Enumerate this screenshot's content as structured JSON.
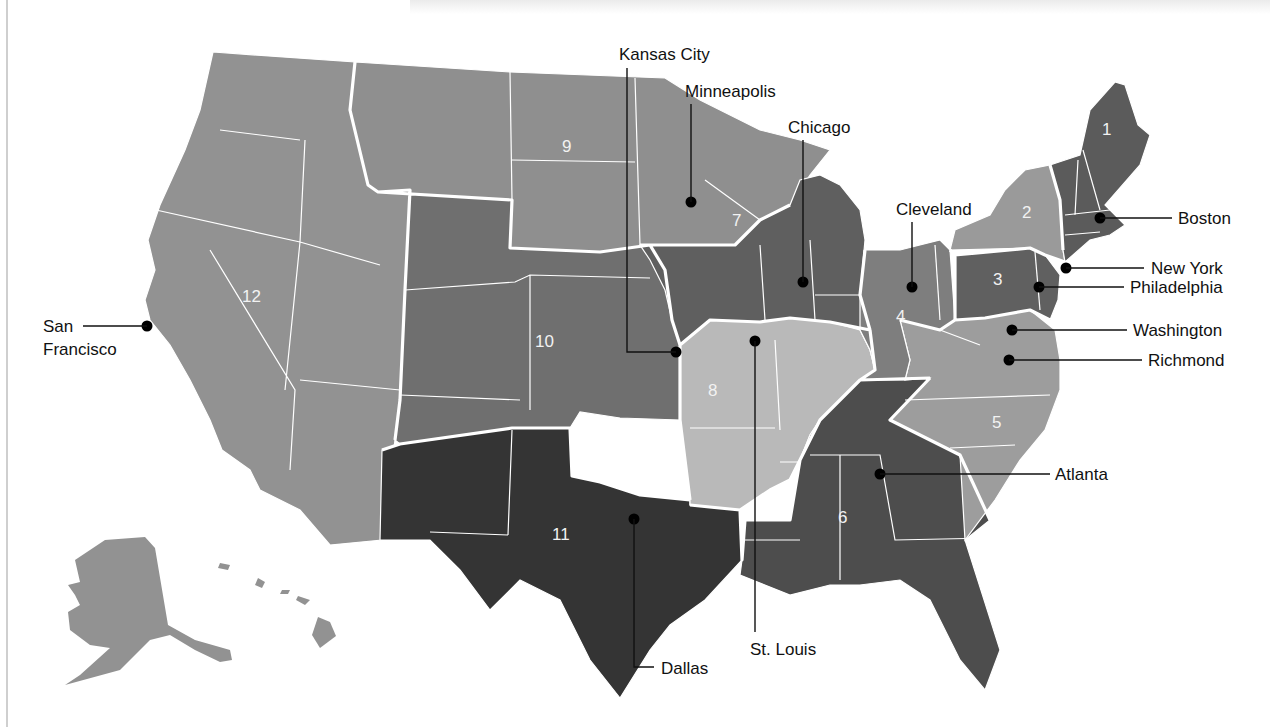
{
  "map": {
    "title": "Federal Reserve Districts",
    "districts": [
      {
        "number": "1",
        "name": "Boston",
        "color": "#5b5b5b"
      },
      {
        "number": "2",
        "name": "New York",
        "color": "#9a9a9a"
      },
      {
        "number": "3",
        "name": "Philadelphia",
        "color": "#606060"
      },
      {
        "number": "4",
        "name": "Cleveland",
        "color": "#7e7e7e"
      },
      {
        "number": "5",
        "name": "Richmond",
        "color": "#9d9d9d"
      },
      {
        "number": "6",
        "name": "Atlanta",
        "color": "#4d4d4d"
      },
      {
        "number": "7",
        "name": "Chicago",
        "color": "#5f5f5f"
      },
      {
        "number": "8",
        "name": "St. Louis",
        "color": "#b9b9b9"
      },
      {
        "number": "9",
        "name": "Minneapolis",
        "color": "#8f8f8f"
      },
      {
        "number": "10",
        "name": "Kansas City",
        "color": "#6f6f6f"
      },
      {
        "number": "11",
        "name": "Dallas",
        "color": "#343434"
      },
      {
        "number": "12",
        "name": "San Francisco",
        "color": "#929292"
      }
    ],
    "cities": [
      {
        "name": "Boston"
      },
      {
        "name": "New York"
      },
      {
        "name": "Philadelphia"
      },
      {
        "name": "Washington"
      },
      {
        "name": "Richmond"
      },
      {
        "name": "Atlanta"
      },
      {
        "name": "Cleveland"
      },
      {
        "name": "Chicago"
      },
      {
        "name": "Minneapolis"
      },
      {
        "name": "Kansas City"
      },
      {
        "name": "St. Louis"
      },
      {
        "name": "Dallas"
      },
      {
        "name": "San Francisco",
        "line1": "San",
        "line2": "Francisco"
      }
    ]
  }
}
